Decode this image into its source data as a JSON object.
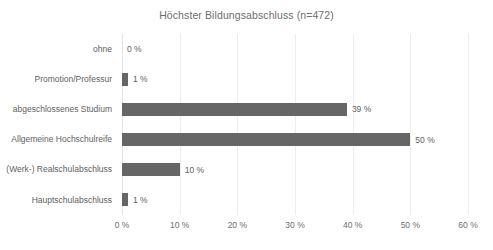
{
  "chart_data": {
    "type": "bar",
    "orientation": "horizontal",
    "title": "Höchster Bildungsabschluss (n=472)",
    "xlabel": "",
    "ylabel": "",
    "xlim": [
      0,
      60
    ],
    "grid": true,
    "legend": false,
    "value_suffix": " %",
    "categories": [
      "ohne",
      "Promotion/Professur",
      "abgeschlossenes Studium",
      "Allgemeine Hochschulreife",
      "(Werk-) Realschulabschluss",
      "Hauptschulabschluss"
    ],
    "values": [
      0,
      1,
      39,
      50,
      10,
      1
    ],
    "data_labels": [
      "0 %",
      "1 %",
      "39 %",
      "50 %",
      "10 %",
      "1 %"
    ],
    "xticks": [
      0,
      10,
      20,
      30,
      40,
      50,
      60
    ],
    "xtick_labels": [
      "0 %",
      "10 %",
      "20 %",
      "30 %",
      "40 %",
      "50 %",
      "60 %"
    ],
    "bar_color": "#666666",
    "gridline_color": "#ededed",
    "text_color": "#616161",
    "title_color": "#6e6e6e",
    "background": "#ffffff"
  },
  "rows": [
    {
      "label": "ohne",
      "value": 0,
      "data_label": "0 %"
    },
    {
      "label": "Promotion/Professur",
      "value": 1,
      "data_label": "1 %"
    },
    {
      "label": "abgeschlossenes Studium",
      "value": 39,
      "data_label": "39 %"
    },
    {
      "label": "Allgemeine Hochschulreife",
      "value": 50,
      "data_label": "50 %"
    },
    {
      "label": "(Werk-) Realschulabschluss",
      "value": 10,
      "data_label": "10 %"
    },
    {
      "label": "Hauptschulabschluss",
      "value": 1,
      "data_label": "1 %"
    }
  ],
  "xticks": [
    {
      "value": 0,
      "label": "0 %"
    },
    {
      "value": 10,
      "label": "10 %"
    },
    {
      "value": 20,
      "label": "20 %"
    },
    {
      "value": 30,
      "label": "30 %"
    },
    {
      "value": 40,
      "label": "40 %"
    },
    {
      "value": 50,
      "label": "50 %"
    },
    {
      "value": 60,
      "label": "60 %"
    }
  ]
}
